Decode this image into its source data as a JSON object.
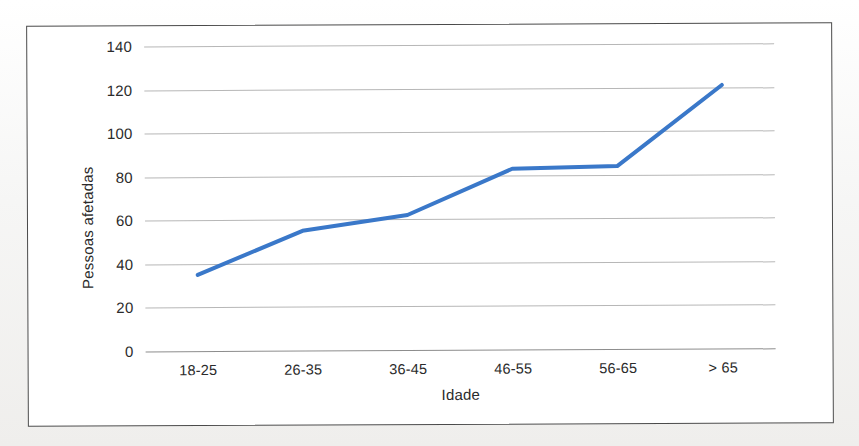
{
  "figure": {
    "frame_color": "#4a4a4a",
    "background_color": "#ffffff"
  },
  "chart_data": {
    "type": "line",
    "title": "",
    "xlabel": "Idade",
    "ylabel": "Pessoas afetadas",
    "categories": [
      "18-25",
      "26-35",
      "36-45",
      "46-55",
      "56-65",
      "> 65"
    ],
    "values": [
      35,
      55,
      62,
      83,
      84,
      121
    ],
    "series": [
      {
        "name": "Pessoas afetadas",
        "values": [
          35,
          55,
          62,
          83,
          84,
          121
        ],
        "color": "#3a78c9"
      }
    ],
    "ylim": [
      0,
      140
    ],
    "yticks": [
      0,
      20,
      40,
      60,
      80,
      100,
      120,
      140
    ],
    "ytick_labels": [
      "0",
      "20",
      "40",
      "60",
      "80",
      "100",
      "120",
      "140"
    ],
    "grid": true,
    "grid_axis": "y",
    "legend": false,
    "legend_position": "none",
    "markers": false,
    "line_width_px": 4,
    "axis_line_color": "#8d8d8d",
    "gridline_color": "#b7b7b7"
  }
}
